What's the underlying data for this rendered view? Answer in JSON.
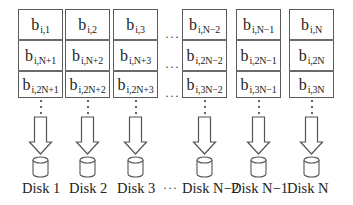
{
  "diagram": {
    "title": "",
    "columns": [
      {
        "id": "col-1",
        "x": 18,
        "w": 45,
        "cells": [
          {
            "base": "b",
            "sub": "i,1"
          },
          {
            "base": "b",
            "sub": "i,N+1"
          },
          {
            "base": "b",
            "sub": "i,2N+1"
          }
        ],
        "disk_label": "Disk 1"
      },
      {
        "id": "col-2",
        "x": 65,
        "w": 45,
        "cells": [
          {
            "base": "b",
            "sub": "i,2"
          },
          {
            "base": "b",
            "sub": "i,N+2"
          },
          {
            "base": "b",
            "sub": "i,2N+2"
          }
        ],
        "disk_label": "Disk 2"
      },
      {
        "id": "col-3",
        "x": 113,
        "w": 45,
        "cells": [
          {
            "base": "b",
            "sub": "i,3"
          },
          {
            "base": "b",
            "sub": "i,N+3"
          },
          {
            "base": "b",
            "sub": "i,2N+3"
          }
        ],
        "disk_label": "Disk 3"
      },
      {
        "id": "col-n-2",
        "x": 182,
        "w": 45,
        "cells": [
          {
            "base": "b",
            "sub": "i,N−2"
          },
          {
            "base": "b",
            "sub": "i,2N−2"
          },
          {
            "base": "b",
            "sub": "i,3N−2"
          }
        ],
        "disk_label": "Disk N−2"
      },
      {
        "id": "col-n-1",
        "x": 236,
        "w": 45,
        "cells": [
          {
            "base": "b",
            "sub": "i,N−1"
          },
          {
            "base": "b",
            "sub": "i,2N−1"
          },
          {
            "base": "b",
            "sub": "i,3N−1"
          }
        ],
        "disk_label": "Disk N−1"
      },
      {
        "id": "col-n",
        "x": 289,
        "w": 45,
        "cells": [
          {
            "base": "b",
            "sub": "i,N"
          },
          {
            "base": "b",
            "sub": "i,2N"
          },
          {
            "base": "b",
            "sub": "i,3N"
          }
        ],
        "disk_label": "Disk N"
      }
    ],
    "rows": [
      {
        "y": 9,
        "h": 31
      },
      {
        "y": 40,
        "h": 31
      },
      {
        "y": 71,
        "h": 27
      }
    ],
    "ellipsis": "···",
    "ellipsis_positions": {
      "grid_x": 165,
      "grid_rows_y": [
        31,
        61,
        90
      ],
      "label_x": 163,
      "label_y": 182
    },
    "label_positions_x": [
      22,
      69,
      117,
      182,
      231,
      287
    ],
    "label_y": 181,
    "arrow": {
      "shaft_w": 12,
      "head_w": 22,
      "top": 117,
      "head_start": 142,
      "tip": 154
    },
    "disk": {
      "w": 15,
      "top": 157,
      "bottom": 177,
      "ellipse_ry": 3
    },
    "colors": {
      "stroke": "#555555",
      "cell_border": "#5a5a5a",
      "row_separator": "#6a6a6a",
      "text": "#222222",
      "background": "#ffffff"
    }
  }
}
